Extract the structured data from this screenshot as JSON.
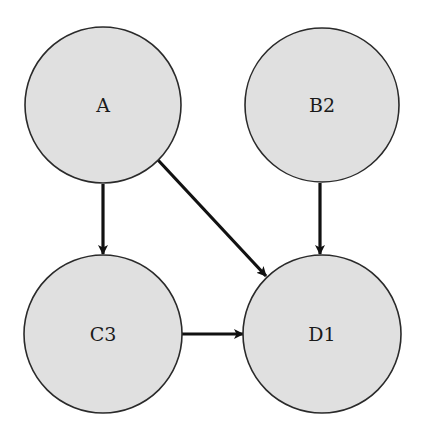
{
  "diagram": {
    "type": "directed-graph",
    "node_style": {
      "fill": "#e0e0e0",
      "stroke": "#2a2a2a",
      "label_color": "#1a1a1a"
    },
    "edge_style": {
      "color": "#111111",
      "arrowhead": "filled"
    },
    "nodes": [
      {
        "id": "A",
        "label": "A",
        "cx": 103,
        "cy": 105,
        "r": 78
      },
      {
        "id": "B2",
        "label": "B2",
        "cx": 322,
        "cy": 105,
        "r": 77
      },
      {
        "id": "C3",
        "label": "C3",
        "cx": 103,
        "cy": 334,
        "r": 79
      },
      {
        "id": "D1",
        "label": "D1",
        "cx": 322,
        "cy": 334,
        "r": 79
      }
    ],
    "edges": [
      {
        "from": "A",
        "to": "C3"
      },
      {
        "from": "A",
        "to": "D1"
      },
      {
        "from": "B2",
        "to": "D1"
      },
      {
        "from": "C3",
        "to": "D1"
      }
    ]
  }
}
